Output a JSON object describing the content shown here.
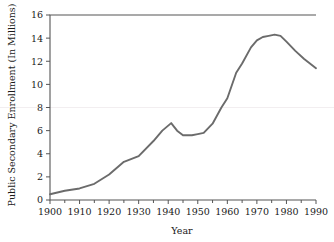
{
  "chart_data": {
    "type": "line",
    "title": "",
    "xlabel": "Year",
    "ylabel": "Public Secondary Enrollment (In Millions)",
    "xlim": [
      1900,
      1990
    ],
    "ylim": [
      0,
      16
    ],
    "grid": false,
    "legend": null,
    "xticks": [
      1900,
      1910,
      1920,
      1930,
      1940,
      1950,
      1960,
      1970,
      1980,
      1990
    ],
    "xtick_labels": [
      "1900",
      "1910",
      "1920",
      "1930",
      "1940",
      "1950",
      "1960",
      "1970",
      "1980",
      "1990"
    ],
    "xminor_ticks": [
      1905,
      1915,
      1925,
      1935,
      1945,
      1955,
      1965,
      1975,
      1985
    ],
    "yticks": [
      0,
      2,
      4,
      6,
      8,
      10,
      12,
      14,
      16
    ],
    "ytick_labels": [
      "0",
      "2",
      "4",
      "6",
      "8",
      "10",
      "12",
      "14",
      "16"
    ],
    "series": [
      {
        "name": "Public Secondary Enrollment",
        "color": "#6b6b6b",
        "x": [
          1900,
          1905,
          1910,
          1915,
          1920,
          1925,
          1930,
          1935,
          1938,
          1941,
          1943,
          1945,
          1948,
          1950,
          1952,
          1955,
          1958,
          1960,
          1963,
          1965,
          1968,
          1970,
          1972,
          1974,
          1976,
          1978,
          1980,
          1983,
          1986,
          1990
        ],
        "y": [
          0.5,
          0.8,
          1.0,
          1.4,
          2.2,
          3.3,
          3.8,
          5.1,
          6.0,
          6.65,
          6.0,
          5.6,
          5.6,
          5.7,
          5.8,
          6.6,
          8.0,
          8.8,
          11.0,
          11.8,
          13.2,
          13.8,
          14.1,
          14.2,
          14.3,
          14.2,
          13.7,
          12.9,
          12.2,
          11.4
        ]
      }
    ]
  },
  "axes": {
    "x_axis_label": "Year",
    "y_axis_label": "Public Secondary Enrollment (In Millions)"
  }
}
